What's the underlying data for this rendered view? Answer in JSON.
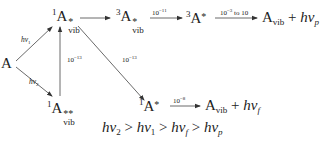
{
  "diagram": {
    "ground_state": "A",
    "excitation_labels": {
      "hv1": {
        "h": "hν",
        "sub": "1"
      },
      "hv2": {
        "h": "hν",
        "sub": "2"
      }
    },
    "singlet_vib": {
      "mult": "1",
      "base": "A",
      "star": "*",
      "sub": "vib"
    },
    "singlet_vib_high": {
      "mult": "1",
      "base": "A",
      "star": "**",
      "sub": "vib"
    },
    "triplet_vib": {
      "mult": "3",
      "base": "A",
      "star": "*",
      "sub": "vib"
    },
    "triplet": {
      "mult": "3",
      "base": "A",
      "star": "*"
    },
    "singlet": {
      "mult": "1",
      "base": "A",
      "star": "*"
    },
    "rates": {
      "isc": {
        "base": "10",
        "exp": "−11"
      },
      "phos": {
        "base": "10",
        "exp": "−3",
        "suffix": " to 10"
      },
      "ic_up": {
        "base": "10",
        "exp": "−13"
      },
      "vr": {
        "base": "10",
        "exp": "−13"
      },
      "fluor": {
        "base": "10",
        "exp": "−8"
      }
    },
    "phos_product": {
      "base": "A",
      "sub": "vib",
      "plus": " + ",
      "h": "hν",
      "nu_sub": "p"
    },
    "fluor_product": {
      "base": "A",
      "sub": "vib",
      "plus": " + ",
      "h": "hν",
      "nu_sub": "f"
    },
    "inequality": {
      "t1": "hν",
      "s1": "2",
      "g1": " > ",
      "t2": "hν",
      "s2": "1",
      "g2": " > ",
      "t3": "hν",
      "s3": "f",
      "g3": " > ",
      "t4": "hν",
      "s4": "p"
    }
  }
}
